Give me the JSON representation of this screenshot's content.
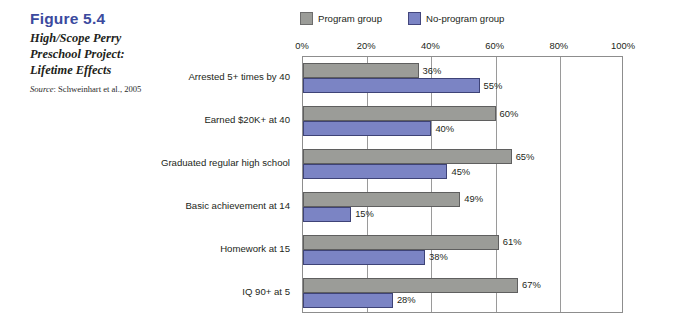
{
  "caption": {
    "figure_number": "Figure 5.4",
    "title": "High/Scope Perry Preschool Project: Lifetime Effects",
    "source_word": "Source",
    "source_rest": ": Schweinhart et al., 2005"
  },
  "colors": {
    "figure_number": "#3b4a9e",
    "program": "#9b9c98",
    "program_border": "#5f5f5f",
    "noprogram": "#7b84c4",
    "noprogram_border": "#3e4377",
    "grid": "#9a9a9a",
    "text": "#231f20"
  },
  "legend": {
    "items": [
      {
        "label": "Program group",
        "swatch": "program"
      },
      {
        "label": "No-program group",
        "swatch": "noprogram"
      }
    ]
  },
  "chart_data": {
    "type": "bar",
    "orientation": "horizontal",
    "title": "High/Scope Perry Preschool Project: Lifetime Effects",
    "xlabel": "",
    "ylabel": "",
    "xlim": [
      0,
      100
    ],
    "xticks": [
      0,
      20,
      40,
      60,
      80,
      100
    ],
    "xtick_labels": [
      "0%",
      "20%",
      "40%",
      "60%",
      "80%",
      "100%"
    ],
    "grid": true,
    "legend_position": "top",
    "value_suffix": "%",
    "categories": [
      "Arrested 5+ times by 40",
      "Earned $20K+ at 40",
      "Graduated regular high school",
      "Basic achievement at 14",
      "Homework at 15",
      "IQ 90+ at 5"
    ],
    "series": [
      {
        "name": "Program group",
        "values": [
          36,
          60,
          65,
          49,
          61,
          67
        ],
        "labels": [
          "36%",
          "60%",
          "65%",
          "49%",
          "61%",
          "67%"
        ]
      },
      {
        "name": "No-program group",
        "values": [
          55,
          40,
          45,
          15,
          38,
          28
        ],
        "labels": [
          "55%",
          "40%",
          "45%",
          "15%",
          "38%",
          "28%"
        ]
      }
    ]
  }
}
